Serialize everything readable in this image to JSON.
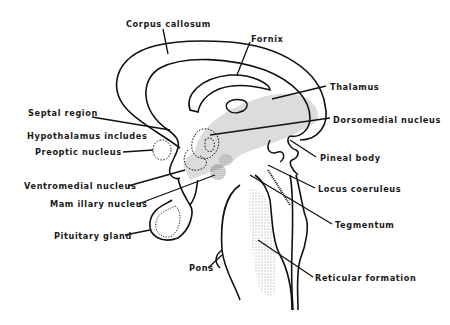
{
  "diagram": {
    "type": "anatomical sagittal section of brain",
    "labels": [
      {
        "id": "corpus-callosum",
        "text": "Corpus callosum",
        "x": 126,
        "y": 19
      },
      {
        "id": "fornix",
        "text": "Fornix",
        "x": 251,
        "y": 34
      },
      {
        "id": "thalamus",
        "text": "Thalamus",
        "x": 330,
        "y": 82
      },
      {
        "id": "septal-region",
        "text": "Septal region",
        "x": 28,
        "y": 108
      },
      {
        "id": "dorsomedial-nucleus",
        "text": "Dorsomedial nucleus",
        "x": 333,
        "y": 115
      },
      {
        "id": "hypothalamus-includes",
        "text": "Hypothalamus includes",
        "x": 27,
        "y": 131
      },
      {
        "id": "preoptic-nucleus",
        "text": "Preoptic nucleus",
        "x": 35,
        "y": 147
      },
      {
        "id": "pineal-body",
        "text": "Pineal body",
        "x": 320,
        "y": 153
      },
      {
        "id": "ventromedial-nucleus",
        "text": "Ventromedial nucleus",
        "x": 24,
        "y": 181
      },
      {
        "id": "locus-coeruleus",
        "text": "Locus coeruleus",
        "x": 318,
        "y": 184
      },
      {
        "id": "mamillary-nucleus",
        "text": "Mam illary nucleus",
        "x": 50,
        "y": 199
      },
      {
        "id": "tegmentum",
        "text": "Tegmentum",
        "x": 335,
        "y": 220
      },
      {
        "id": "pituitary-gland",
        "text": "Pituitary gland",
        "x": 54,
        "y": 231
      },
      {
        "id": "pons",
        "text": "Pons",
        "x": 189,
        "y": 263
      },
      {
        "id": "reticular-formation",
        "text": "Reticular formation",
        "x": 315,
        "y": 273
      }
    ]
  }
}
